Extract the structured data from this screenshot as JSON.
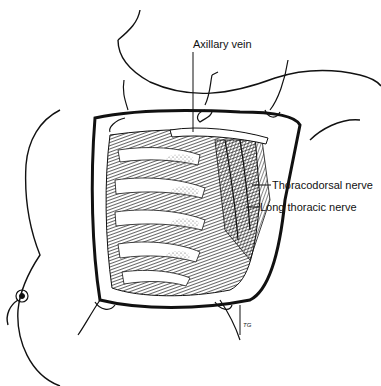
{
  "figure": {
    "labels": {
      "axillary_vein": "Axillary vein",
      "thoracodorsal_nerve": "Thoracodorsal nerve",
      "long_thoracic_nerve": "Long thoracic nerve"
    },
    "artist_signature": "TG"
  }
}
